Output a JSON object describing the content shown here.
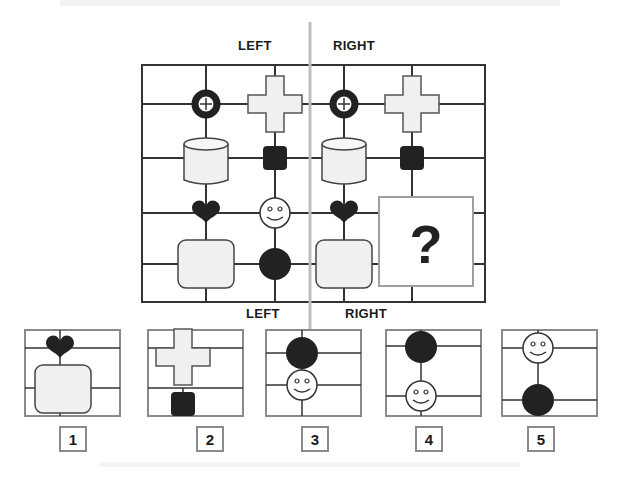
{
  "puzzle": {
    "top_labels": {
      "left": "LEFT",
      "right": "RIGHT"
    },
    "bottom_labels": {
      "left": "LEFT",
      "right": "RIGHT"
    },
    "question_mark": "?",
    "left_panel": {
      "col1": [
        "target-ring",
        "cylinder",
        "heart",
        "rounded-square"
      ],
      "col2": [
        "cross",
        "black-square",
        "smiley",
        "black-circle"
      ]
    },
    "right_panel": {
      "col1": [
        "target-ring",
        "cylinder",
        "heart",
        "rounded-square"
      ],
      "col2": [
        "cross",
        "black-square",
        "missing",
        "missing"
      ]
    }
  },
  "options": [
    {
      "number": "1",
      "content": [
        "heart",
        "rounded-square"
      ]
    },
    {
      "number": "2",
      "content": [
        "cross",
        "black-square"
      ]
    },
    {
      "number": "3",
      "content": [
        "black-circle",
        "smiley"
      ]
    },
    {
      "number": "4",
      "content": [
        "black-circle",
        "smiley"
      ]
    },
    {
      "number": "5",
      "content": [
        "smiley",
        "black-circle"
      ]
    }
  ],
  "colors": {
    "line": "#333333",
    "fill_light": "#f0f0f0",
    "fill_dark": "#222222",
    "divider": "#bdbdbd",
    "box_border": "#8a8a8a"
  }
}
